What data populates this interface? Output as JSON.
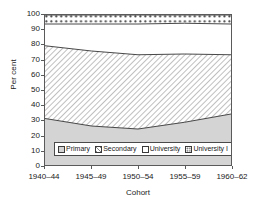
{
  "chart_data": {
    "type": "area",
    "title": "",
    "subtitle": "",
    "xlabel": "Cohort",
    "ylabel": "Per cent",
    "categories": [
      "1940–44",
      "1945–49",
      "1950–54",
      "1955–59",
      "1960–62"
    ],
    "ylim": [
      0,
      100
    ],
    "yticks": [
      0,
      10,
      20,
      30,
      40,
      50,
      60,
      70,
      80,
      90,
      100
    ],
    "ytick_labels": [
      "0",
      "10",
      "20",
      "30",
      "40",
      "50",
      "60",
      "70",
      "80",
      "90",
      "100"
    ],
    "grid": false,
    "legend_position": "lower-center-inside",
    "stacked": true,
    "series": [
      {
        "name": "Primary",
        "pattern": "solid-gray",
        "values": [
          31,
          26,
          24,
          28.5,
          34
        ]
      },
      {
        "name": "Secondary",
        "pattern": "diagonal-hatch",
        "values": [
          48.5,
          50,
          49.5,
          45.5,
          39.5
        ]
      },
      {
        "name": "University",
        "pattern": "white",
        "values": [
          14.5,
          14,
          14.5,
          14.5,
          14
        ]
      },
      {
        "name": "University I",
        "pattern": "dotted",
        "values": [
          6,
          6,
          6,
          6,
          6
        ]
      }
    ],
    "cumulative_boundaries": {
      "primary_top": [
        31,
        26,
        24,
        28.5,
        34
      ],
      "secondary_top": [
        79.5,
        76,
        73.5,
        74,
        73.5
      ],
      "university_top": [
        94,
        94,
        94,
        94.5,
        94
      ],
      "total_top": [
        100,
        100,
        100,
        100,
        100
      ]
    },
    "colors": {
      "axis": "#5a5a5a",
      "text": "#1a1a1a",
      "line": "#333333",
      "primary_fill": "#d4d4d4",
      "secondary_fill": "#ffffff",
      "university_fill": "#ffffff",
      "university_i_fill": "#ffffff",
      "legend_border": "#4a4a4a",
      "background": "#ffffff"
    }
  },
  "legend": {
    "items": [
      {
        "label": "Primary"
      },
      {
        "label": "Secondary"
      },
      {
        "label": "University"
      },
      {
        "label": "University I"
      }
    ]
  },
  "axes": {
    "y_title": "Per cent",
    "x_title": "Cohort"
  }
}
